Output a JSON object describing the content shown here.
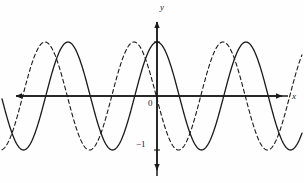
{
  "figure": {
    "background_color": "#fefefe",
    "ink_color": "#1a1a1a"
  },
  "axes": {
    "x_axis_label": "x",
    "y_axis_label": "y",
    "origin_label": "0",
    "y_tick_labels": [
      "−1"
    ],
    "x_axis_pixel_y": 96,
    "y_axis_pixel_x": 157,
    "x_axis_start_px": 10,
    "x_axis_end_px": 288,
    "y_axis_top_px": 16,
    "y_axis_bottom_px": 176,
    "arrowheads": [
      "left",
      "right",
      "up",
      "down"
    ],
    "y_tick_marks": [
      {
        "label": "1",
        "pixel_y": 42,
        "shown": false
      },
      {
        "label": "−1",
        "pixel_y": 150,
        "shown": true
      }
    ]
  },
  "chart_data": {
    "type": "line",
    "title": "",
    "xlabel": "x",
    "ylabel": "y",
    "grid": false,
    "legend": false,
    "xlim": [
      -1.77,
      1.47
    ],
    "ylim": [
      -1.5,
      1.5
    ],
    "y_ticks": [
      -1,
      1
    ],
    "y_tick_labels": [
      "−1",
      "1"
    ],
    "x_ticks": [],
    "series": [
      {
        "name": "solid-cosine",
        "style": "solid",
        "color": "#1a1a1a",
        "linewidth": 1.3,
        "amplitude": 1,
        "period_px": 89,
        "phase_shift_px": 0,
        "peaks_px": [
          68,
          157,
          246
        ],
        "troughs_px": [
          23,
          112,
          201,
          290
        ],
        "zero_crossings_px": [
          1,
          45,
          90,
          134,
          179,
          223,
          268
        ],
        "description": "cosine-like wave with maximum on the y-axis"
      },
      {
        "name": "dashed-cosine-shifted",
        "style": "dashed",
        "color": "#1a1a1a",
        "linewidth": 1.1,
        "dash_pattern": "4 3",
        "amplitude": 1,
        "period_px": 89,
        "phase_shift_px": -23,
        "peaks_px": [
          45,
          134,
          223
        ],
        "troughs_px": [
          0,
          89,
          178,
          267
        ],
        "zero_crossings_px": [
          22,
          67,
          111,
          156,
          200,
          245,
          289
        ],
        "description": "same wave shifted left by a quarter period"
      }
    ]
  }
}
